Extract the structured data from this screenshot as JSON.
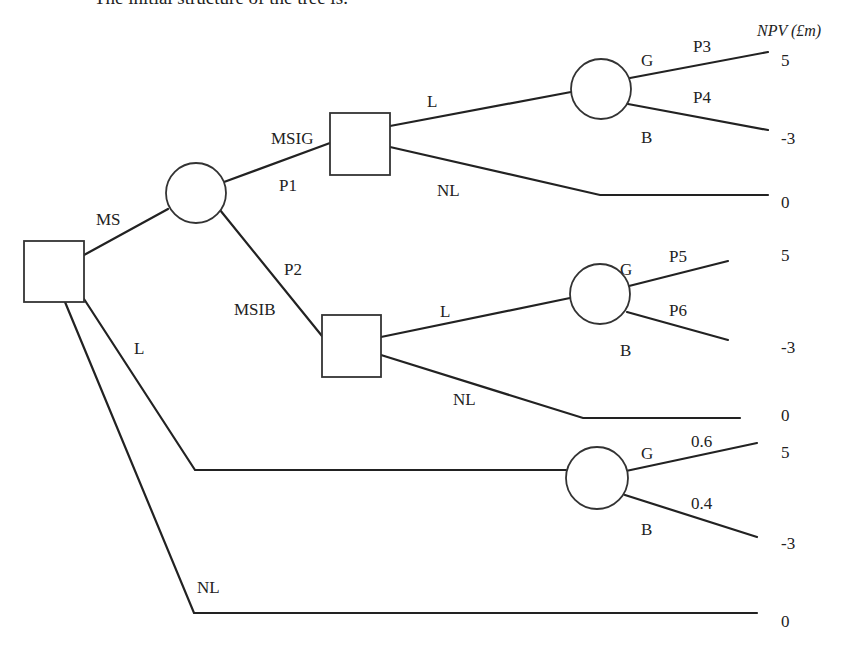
{
  "page": {
    "truncated_caption": "The initial structure of the tree is:",
    "npv_header": "NPV (£m)"
  },
  "colors": {
    "ink": "#222222",
    "background": "#ffffff"
  },
  "nodes": [
    {
      "id": "root",
      "type": "decision",
      "x": 24,
      "y": 241,
      "w": 60,
      "h": 61
    },
    {
      "id": "ms-chance",
      "type": "chance",
      "cx": 196,
      "cy": 193,
      "r": 30
    },
    {
      "id": "msig-decision",
      "type": "decision",
      "x": 330,
      "y": 113,
      "w": 60,
      "h": 62
    },
    {
      "id": "msig-l-chance",
      "type": "chance",
      "cx": 601,
      "cy": 89,
      "r": 30
    },
    {
      "id": "msib-decision",
      "type": "decision",
      "x": 322,
      "y": 315,
      "w": 59,
      "h": 62
    },
    {
      "id": "msib-l-chance",
      "type": "chance",
      "cx": 600,
      "cy": 294,
      "r": 30
    },
    {
      "id": "l-chance",
      "type": "chance",
      "cx": 597,
      "cy": 478,
      "r": 31
    }
  ],
  "edges": [
    {
      "id": "root-ms",
      "points": [
        [
          84,
          255
        ],
        [
          168,
          209
        ]
      ]
    },
    {
      "id": "ms-msig",
      "points": [
        [
          224,
          182
        ],
        [
          330,
          143
        ]
      ]
    },
    {
      "id": "ms-msib",
      "points": [
        [
          220,
          210
        ],
        [
          322,
          336
        ]
      ]
    },
    {
      "id": "msig-l",
      "points": [
        [
          390,
          126
        ],
        [
          571,
          92
        ]
      ]
    },
    {
      "id": "msig-l-g",
      "points": [
        [
          630,
          78
        ],
        [
          768,
          52
        ]
      ]
    },
    {
      "id": "msig-l-b",
      "points": [
        [
          628,
          104
        ],
        [
          768,
          130
        ]
      ]
    },
    {
      "id": "msig-nl",
      "points": [
        [
          390,
          147
        ],
        [
          600,
          195
        ],
        [
          768,
          195
        ]
      ]
    },
    {
      "id": "msib-l",
      "points": [
        [
          381,
          337
        ],
        [
          570,
          298
        ]
      ]
    },
    {
      "id": "msib-l-g",
      "points": [
        [
          629,
          286
        ],
        [
          728,
          261
        ]
      ]
    },
    {
      "id": "msib-l-b",
      "points": [
        [
          627,
          312
        ],
        [
          728,
          340
        ]
      ]
    },
    {
      "id": "msib-nl",
      "points": [
        [
          381,
          355
        ],
        [
          583,
          418
        ],
        [
          740,
          418
        ]
      ]
    },
    {
      "id": "root-l",
      "points": [
        [
          84,
          299
        ],
        [
          195,
          470
        ],
        [
          566,
          470
        ]
      ]
    },
    {
      "id": "l-g",
      "points": [
        [
          626,
          471
        ],
        [
          757,
          443
        ]
      ]
    },
    {
      "id": "l-b",
      "points": [
        [
          625,
          495
        ],
        [
          757,
          537
        ]
      ]
    },
    {
      "id": "root-nl",
      "points": [
        [
          65,
          302
        ],
        [
          194,
          613
        ],
        [
          757,
          613
        ]
      ]
    }
  ],
  "labels": [
    {
      "id": "label-ms",
      "text": "MS",
      "x": 96,
      "y": 225
    },
    {
      "id": "label-msig",
      "text": "MSIG",
      "x": 271,
      "y": 144
    },
    {
      "id": "label-p1",
      "text": "P1",
      "x": 279,
      "y": 191
    },
    {
      "id": "label-p2",
      "text": "P2",
      "x": 284,
      "y": 275
    },
    {
      "id": "label-msib",
      "text": "MSIB",
      "x": 234,
      "y": 315
    },
    {
      "id": "label-l-root",
      "text": "L",
      "x": 134,
      "y": 354
    },
    {
      "id": "label-l-msig",
      "text": "L",
      "x": 427,
      "y": 107
    },
    {
      "id": "label-nl-msig",
      "text": "NL",
      "x": 437,
      "y": 196
    },
    {
      "id": "label-g-top",
      "text": "G",
      "x": 641,
      "y": 66
    },
    {
      "id": "label-p3",
      "text": "P3",
      "x": 693,
      "y": 52
    },
    {
      "id": "label-p4",
      "text": "P4",
      "x": 693,
      "y": 103
    },
    {
      "id": "label-b-top",
      "text": "B",
      "x": 641,
      "y": 143
    },
    {
      "id": "label-l-msib",
      "text": "L",
      "x": 440,
      "y": 317
    },
    {
      "id": "label-nl-msib",
      "text": "NL",
      "x": 453,
      "y": 405
    },
    {
      "id": "label-g-mid",
      "text": "G",
      "x": 620,
      "y": 275
    },
    {
      "id": "label-p5",
      "text": "P5",
      "x": 669,
      "y": 262
    },
    {
      "id": "label-p6",
      "text": "P6",
      "x": 669,
      "y": 316
    },
    {
      "id": "label-b-mid",
      "text": "B",
      "x": 620,
      "y": 356
    },
    {
      "id": "label-g-l",
      "text": "G",
      "x": 641,
      "y": 459
    },
    {
      "id": "label-p06",
      "text": "0.6",
      "x": 691,
      "y": 447
    },
    {
      "id": "label-p04",
      "text": "0.4",
      "x": 691,
      "y": 509
    },
    {
      "id": "label-b-l",
      "text": "B",
      "x": 641,
      "y": 535
    },
    {
      "id": "label-nl-root",
      "text": "NL",
      "x": 197,
      "y": 593
    }
  ],
  "payoffs": [
    {
      "id": "payoff-top-g",
      "text": "5",
      "x": 781,
      "y": 66
    },
    {
      "id": "payoff-top-b",
      "text": "-3",
      "x": 781,
      "y": 144
    },
    {
      "id": "payoff-top-nl",
      "text": "0",
      "x": 781,
      "y": 208
    },
    {
      "id": "payoff-mid-g",
      "text": "5",
      "x": 781,
      "y": 261
    },
    {
      "id": "payoff-mid-b",
      "text": "-3",
      "x": 781,
      "y": 353
    },
    {
      "id": "payoff-mid-nl",
      "text": "0",
      "x": 781,
      "y": 421
    },
    {
      "id": "payoff-l-g",
      "text": "5",
      "x": 781,
      "y": 458
    },
    {
      "id": "payoff-l-b",
      "text": "-3",
      "x": 781,
      "y": 549
    },
    {
      "id": "payoff-nl",
      "text": "0",
      "x": 781,
      "y": 627
    }
  ],
  "header_pos": {
    "x": 757,
    "y": 36
  },
  "caption_pos": {
    "x": 94,
    "y": 4
  }
}
